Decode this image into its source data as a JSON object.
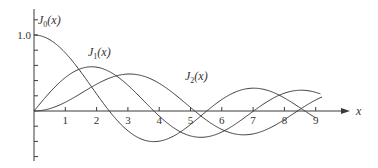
{
  "chart_data": {
    "type": "line",
    "title": "",
    "xlabel": "x",
    "ylabel": "",
    "xlim": [
      0,
      9.8
    ],
    "ylim": [
      -0.65,
      1.3
    ],
    "x_ticks": [
      1,
      2,
      3,
      4,
      5,
      6,
      7,
      8,
      9
    ],
    "x_tick_labels": [
      "1",
      "2",
      "3",
      "4",
      "5",
      "6",
      "7",
      "8",
      "9"
    ],
    "y_tick_labels": [
      {
        "value": 1.0,
        "label": "1.0"
      }
    ],
    "y_minor_tick_step": 0.2,
    "grid": false,
    "legend": "inline labels",
    "series": [
      {
        "name": "J0(x)",
        "label": "J",
        "subscript": "0",
        "arg": "(x)",
        "x": [
          0,
          1,
          2,
          2.405,
          3,
          3.832,
          4,
          5,
          5.52,
          6,
          7,
          7.016,
          8,
          8.654,
          9
        ],
        "values": [
          1.0,
          0.765,
          0.224,
          0.0,
          -0.26,
          -0.403,
          -0.397,
          -0.178,
          0.0,
          0.151,
          0.3,
          0.3,
          0.172,
          0.0,
          -0.09
        ]
      },
      {
        "name": "J1(x)",
        "label": "J",
        "subscript": "1",
        "arg": "(x)",
        "x": [
          0,
          1,
          1.841,
          2,
          3,
          3.832,
          4,
          5,
          5.331,
          6,
          7,
          7.016,
          8,
          8.536,
          9
        ],
        "values": [
          0.0,
          0.44,
          0.582,
          0.577,
          0.339,
          0.0,
          -0.066,
          -0.328,
          -0.346,
          -0.277,
          -0.005,
          0.0,
          0.235,
          0.273,
          0.245
        ]
      },
      {
        "name": "J2(x)",
        "label": "J",
        "subscript": "2",
        "arg": "(x)",
        "x": [
          0,
          1,
          2,
          3,
          3.054,
          4,
          5,
          5.136,
          6,
          6.706,
          7,
          8,
          8.417,
          9
        ],
        "values": [
          0.0,
          0.115,
          0.353,
          0.486,
          0.486,
          0.364,
          0.047,
          0.0,
          -0.243,
          -0.301,
          -0.301,
          -0.113,
          0.0,
          0.145
        ]
      }
    ]
  }
}
